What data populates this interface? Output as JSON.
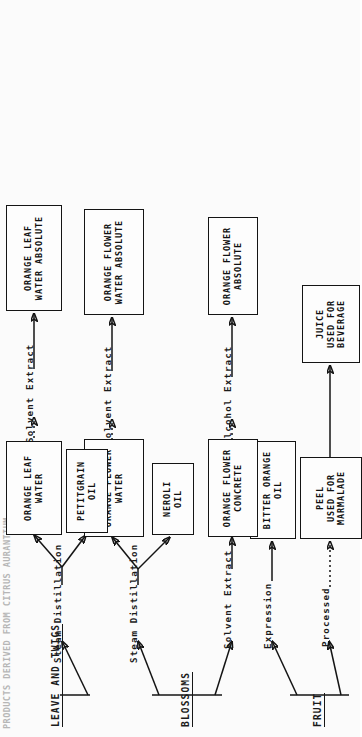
{
  "diagram": {
    "title": "PRODUCTS DERIVED FROM CITRUS AURANTIUM",
    "orientation": "rotated-90-ccw",
    "type": "flowchart",
    "groups": [
      {
        "id": "fruit",
        "label": "FRUIT"
      },
      {
        "id": "blossoms",
        "label": "BLOSSOMS"
      },
      {
        "id": "leaves",
        "label": "LEAVE AND TWIGS"
      }
    ],
    "processes": [
      {
        "id": "processed",
        "label": "Processed"
      },
      {
        "id": "expression",
        "label": "Expression"
      },
      {
        "id": "solvent-1",
        "label": "Solvent Extract"
      },
      {
        "id": "steam-1",
        "label": "Steam Distillation"
      },
      {
        "id": "steam-2",
        "label": "Steam Distillation"
      },
      {
        "id": "alcohol",
        "label": "Alcohol Extract"
      },
      {
        "id": "solvent-2",
        "label": "Solvent Extract"
      },
      {
        "id": "solvent-3",
        "label": "Solvent Extract"
      }
    ],
    "products": [
      {
        "id": "peel",
        "lines": [
          "PEEL",
          "USED FOR",
          "MARMALADE"
        ]
      },
      {
        "id": "juice",
        "lines": [
          "JUICE",
          "USED FOR",
          "BEVERAGE"
        ]
      },
      {
        "id": "bitter-oil",
        "lines": [
          "BITTER ORANGE",
          "OIL"
        ]
      },
      {
        "id": "of-concrete",
        "lines": [
          "ORANGE FLOWER",
          "CONCRETE"
        ]
      },
      {
        "id": "of-absolute",
        "lines": [
          "ORANGE FLOWER",
          "ABSOLUTE"
        ]
      },
      {
        "id": "neroli",
        "lines": [
          "NEROLI",
          "OIL"
        ]
      },
      {
        "id": "ofw",
        "lines": [
          "ORANGE FLOWER",
          "WATER"
        ]
      },
      {
        "id": "ofw-abs",
        "lines": [
          "ORANGE FLOWER",
          "WATER ABSOLUTE"
        ]
      },
      {
        "id": "petitgrain",
        "lines": [
          "PETITGRAIN",
          "OIL"
        ]
      },
      {
        "id": "olw",
        "lines": [
          "ORANGE LEAF",
          "WATER"
        ]
      },
      {
        "id": "olw-abs",
        "lines": [
          "ORANGE LEAF",
          "WATER ABSOLUTE"
        ]
      }
    ],
    "colors": {
      "ink": "#141414",
      "paper": "#fbfbfb",
      "faded": "#8d8d8d"
    }
  }
}
